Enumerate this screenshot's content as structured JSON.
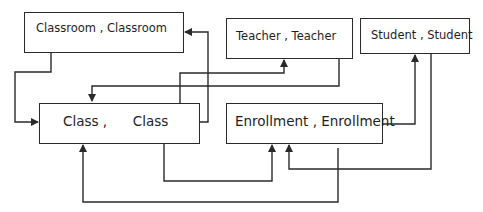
{
  "diagram": {
    "type": "entity-relationship diagram",
    "entities": [
      {
        "id": "classroom",
        "label": "Classroom , Classroom"
      },
      {
        "id": "teacher",
        "label": "Teacher , Teacher"
      },
      {
        "id": "student",
        "label": "Student , Student"
      },
      {
        "id": "class",
        "label": "Class ,      Class"
      },
      {
        "id": "enrollment",
        "label": "Enrollment , Enrollment"
      }
    ],
    "connectors": [
      {
        "from": "classroom",
        "to": "class"
      },
      {
        "from": "class",
        "to": "classroom"
      },
      {
        "from": "class",
        "to": "teacher"
      },
      {
        "from": "teacher",
        "to": "class"
      },
      {
        "from": "class",
        "to": "enrollment"
      },
      {
        "from": "enrollment",
        "to": "class"
      },
      {
        "from": "enrollment",
        "to": "student"
      },
      {
        "from": "student",
        "to": "enrollment"
      }
    ],
    "colors": {
      "line": "#2a2a2a",
      "background": "#ffffff",
      "text": "#1e1e1e"
    }
  }
}
